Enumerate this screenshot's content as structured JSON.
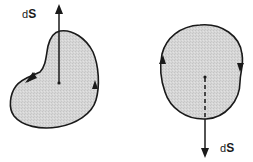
{
  "diagram": {
    "type": "surface-orientation",
    "colors": {
      "background": "#ffffff",
      "surface_fill": "#d4d4d4",
      "stroke": "#1a1a1a"
    },
    "figures": [
      {
        "id": "left",
        "shape": "kidney",
        "normal_direction": "up",
        "circulation": "counterclockwise",
        "label": {
          "d": "d",
          "s": "S"
        }
      },
      {
        "id": "right",
        "shape": "oval",
        "normal_direction": "down",
        "circulation": "clockwise",
        "normal_hidden_segment": "dashed",
        "label": {
          "d": "d",
          "s": "S"
        }
      }
    ]
  }
}
